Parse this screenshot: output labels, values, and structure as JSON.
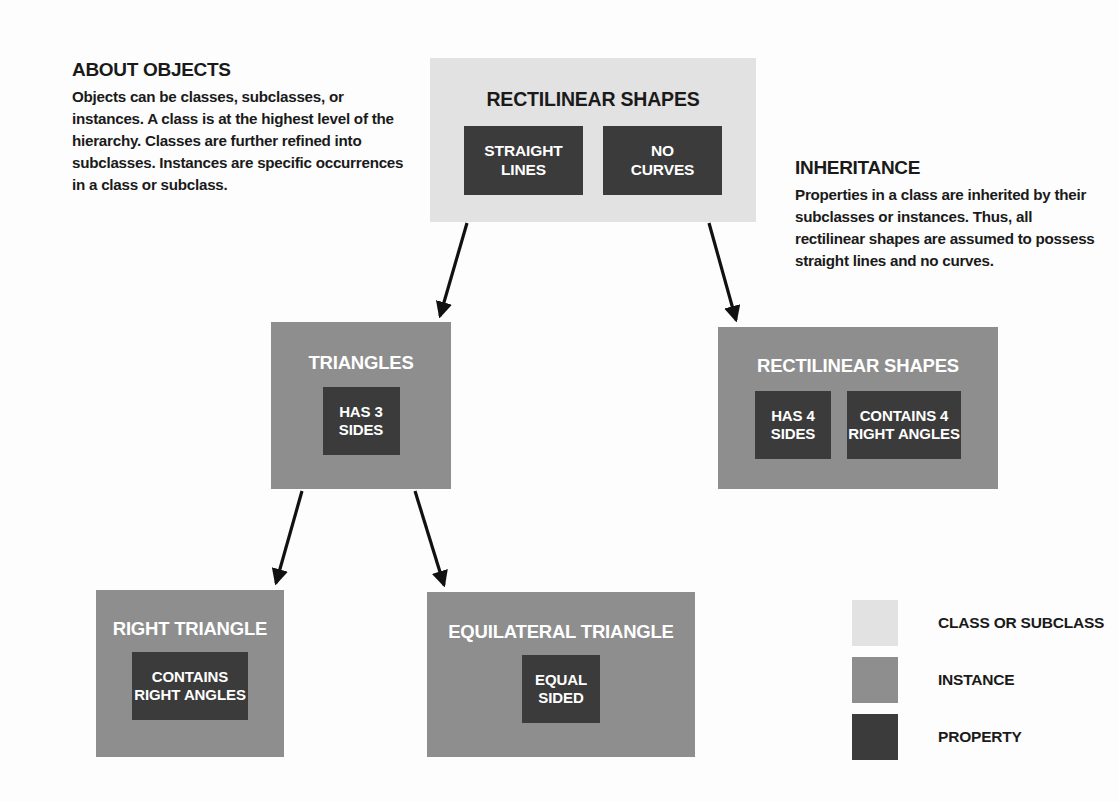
{
  "notes": [
    {
      "id": "about-objects",
      "title": "ABOUT OBJECTS",
      "body": "Objects can be classes, subclasses, or instances. A class is at the highest level of the hierarchy. Classes are further refined into subclasses. Instances are specific occurrences in a class or subclass."
    },
    {
      "id": "inheritance",
      "title": "INHERITANCE",
      "body": "Properties in a class are inherited by their subclasses or instances. Thus, all rectilinear shapes are assumed to possess straight lines and no curves."
    }
  ],
  "nodes": {
    "root": {
      "title": "RECTILINEAR SHAPES",
      "kind": "class",
      "properties": [
        {
          "line1": "STRAIGHT",
          "line2": "LINES"
        },
        {
          "line1": "NO",
          "line2": "CURVES"
        }
      ]
    },
    "triangles": {
      "title": "TRIANGLES",
      "kind": "instance",
      "properties": [
        {
          "line1": "HAS 3",
          "line2": "SIDES"
        }
      ]
    },
    "rectilinear": {
      "title": "RECTILINEAR SHAPES",
      "kind": "instance",
      "properties": [
        {
          "line1": "HAS 4",
          "line2": "SIDES"
        },
        {
          "line1": "CONTAINS 4",
          "line2": "RIGHT ANGLES"
        }
      ]
    },
    "right_triangle": {
      "title": "RIGHT TRIANGLE",
      "kind": "instance",
      "properties": [
        {
          "line1": "CONTAINS",
          "line2": "RIGHT ANGLES"
        }
      ]
    },
    "equilateral": {
      "title": "EQUILATERAL TRIANGLE",
      "kind": "instance",
      "properties": [
        {
          "line1": "EQUAL",
          "line2": "SIDED"
        }
      ]
    }
  },
  "legend": {
    "items": [
      {
        "label": "CLASS OR SUBCLASS",
        "swatch": "class",
        "color": "#e2e2e2"
      },
      {
        "label": "INSTANCE",
        "swatch": "instance",
        "color": "#8e8e8e"
      },
      {
        "label": "PROPERTY",
        "swatch": "property",
        "color": "#3b3b3b"
      }
    ]
  },
  "edges": [
    {
      "from": "root",
      "to": "triangles"
    },
    {
      "from": "root",
      "to": "rectilinear"
    },
    {
      "from": "triangles",
      "to": "right_triangle"
    },
    {
      "from": "triangles",
      "to": "equilateral"
    }
  ],
  "colors": {
    "class": "#e2e2e2",
    "instance": "#8e8e8e",
    "property": "#3b3b3b",
    "text_dark": "#1a1a1a",
    "text_light": "#ffffff",
    "arrow": "#111111",
    "background": "#fdfdfd"
  }
}
